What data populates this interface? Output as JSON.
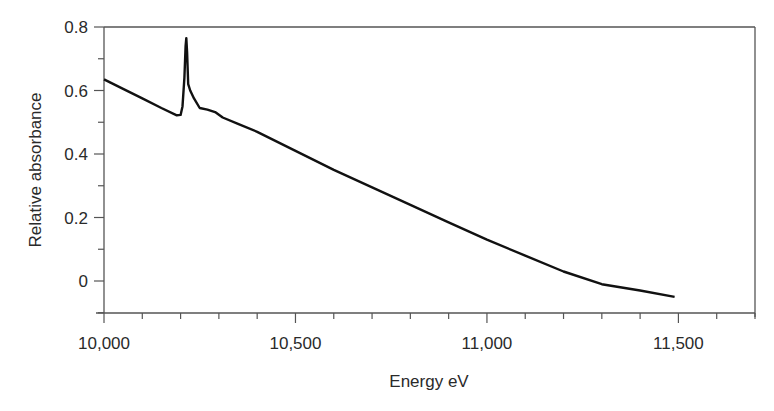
{
  "chart_data": {
    "type": "line",
    "title": "",
    "xlabel": "Energy eV",
    "ylabel": "Relative absorbance",
    "xlim": [
      10000,
      11700
    ],
    "ylim": [
      -0.1,
      0.8
    ],
    "x_ticks": [
      10000,
      10500,
      11000,
      11500
    ],
    "x_tick_labels": [
      "10,000",
      "10,500",
      "11,000",
      "11,500"
    ],
    "x_minor_step": 100,
    "y_ticks": [
      0,
      0.2,
      0.4,
      0.6,
      0.8
    ],
    "y_tick_labels": [
      "0",
      "0.2",
      "0.4",
      "0.6",
      "0.8"
    ],
    "y_minor_step": 0.1,
    "grid": false,
    "legend": null,
    "series": [
      {
        "name": "Absorbance spectrum",
        "color": "#111111",
        "x": [
          10000,
          10050,
          10100,
          10150,
          10190,
          10200,
          10205,
          10210,
          10213,
          10215,
          10217,
          10220,
          10225,
          10235,
          10250,
          10270,
          10290,
          10310,
          10350,
          10400,
          10500,
          10600,
          10700,
          10800,
          10900,
          11000,
          11100,
          11200,
          11300,
          11400,
          11490
        ],
        "y": [
          0.635,
          0.605,
          0.575,
          0.545,
          0.522,
          0.523,
          0.55,
          0.64,
          0.74,
          0.765,
          0.72,
          0.62,
          0.6,
          0.575,
          0.545,
          0.54,
          0.532,
          0.515,
          0.495,
          0.47,
          0.41,
          0.35,
          0.295,
          0.24,
          0.185,
          0.13,
          0.08,
          0.03,
          -0.01,
          -0.03,
          -0.05
        ]
      }
    ]
  }
}
